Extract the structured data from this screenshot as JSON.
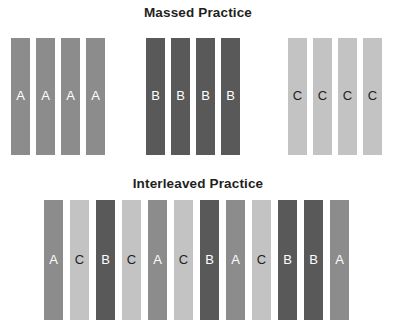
{
  "figure": {
    "background_color": "#ffffff",
    "width": 396,
    "height": 330
  },
  "sections": {
    "massed": {
      "title": "Massed Practice",
      "row_top": 38,
      "row_height": 117,
      "bar_width": 19,
      "bars": [
        {
          "label": "A",
          "kind": "A",
          "x": 11
        },
        {
          "label": "A",
          "kind": "A",
          "x": 36
        },
        {
          "label": "A",
          "kind": "A",
          "x": 61
        },
        {
          "label": "A",
          "kind": "A",
          "x": 86
        },
        {
          "label": "B",
          "kind": "B",
          "x": 146
        },
        {
          "label": "B",
          "kind": "B",
          "x": 171
        },
        {
          "label": "B",
          "kind": "B",
          "x": 196
        },
        {
          "label": "B",
          "kind": "B",
          "x": 221
        },
        {
          "label": "C",
          "kind": "C",
          "x": 288
        },
        {
          "label": "C",
          "kind": "C",
          "x": 313
        },
        {
          "label": "C",
          "kind": "C",
          "x": 338
        },
        {
          "label": "C",
          "kind": "C",
          "x": 363
        }
      ]
    },
    "interleaved": {
      "title": "Interleaved Practice",
      "row_top": 200,
      "row_height": 120,
      "bar_width": 19,
      "bars": [
        {
          "label": "A",
          "kind": "A",
          "x": 44
        },
        {
          "label": "C",
          "kind": "C",
          "x": 70
        },
        {
          "label": "B",
          "kind": "B",
          "x": 96
        },
        {
          "label": "C",
          "kind": "C",
          "x": 122
        },
        {
          "label": "A",
          "kind": "A",
          "x": 148
        },
        {
          "label": "C",
          "kind": "C",
          "x": 174
        },
        {
          "label": "B",
          "kind": "B",
          "x": 200
        },
        {
          "label": "A",
          "kind": "A",
          "x": 226
        },
        {
          "label": "C",
          "kind": "C",
          "x": 252
        },
        {
          "label": "B",
          "kind": "B",
          "x": 278
        },
        {
          "label": "B",
          "kind": "B",
          "x": 304
        },
        {
          "label": "A",
          "kind": "A",
          "x": 330
        }
      ]
    }
  },
  "legend_colors": {
    "A": "#8c8c8c",
    "B": "#595959",
    "C": "#c3c3c3",
    "title": "#231f20",
    "light_label": "#ffffff",
    "dark_label": "#231f20"
  }
}
